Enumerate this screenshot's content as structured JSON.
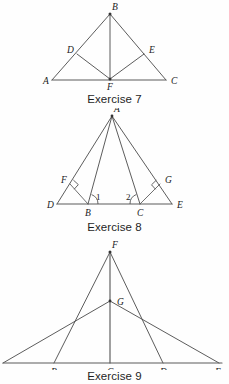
{
  "page": {
    "background_color": "#fefefe",
    "ink_color": "#4a4a4a",
    "label_color": "#1a1a1a"
  },
  "figures": [
    {
      "id": "figure-7",
      "caption": "Exercise 7",
      "description": "Triangle ABC with cevian BF to base AC, and segments DF and EF drawn to points D on AB and E on BC.",
      "points": [
        {
          "name": "A",
          "label": "A",
          "x": 52,
          "y": 80,
          "label_dx": -9,
          "label_dy": 4
        },
        {
          "name": "B",
          "label": "B",
          "x": 110,
          "y": 14,
          "label_dx": 2,
          "label_dy": -4
        },
        {
          "name": "C",
          "label": "C",
          "x": 166,
          "y": 80,
          "label_dx": 5,
          "label_dy": 4
        },
        {
          "name": "D",
          "label": "D",
          "x": 77,
          "y": 54,
          "label_dx": -10,
          "label_dy": -1
        },
        {
          "name": "E",
          "label": "E",
          "x": 144,
          "y": 54,
          "label_dx": 5,
          "label_dy": -1
        },
        {
          "name": "F",
          "label": "F",
          "x": 110,
          "y": 79,
          "label_dx": -2,
          "label_dy": 11
        }
      ],
      "segments": [
        {
          "from": "A",
          "to": "B",
          "style": "gline"
        },
        {
          "from": "B",
          "to": "C",
          "style": "gline"
        },
        {
          "from": "A",
          "to": "C",
          "style": "gline-base"
        },
        {
          "from": "B",
          "to": "F",
          "style": "gline"
        },
        {
          "from": "D",
          "to": "F",
          "style": "gline"
        },
        {
          "from": "E",
          "to": "F",
          "style": "gline"
        }
      ],
      "vertex_dots": [
        "B",
        "F"
      ],
      "angle_marks": [],
      "right_angles": []
    },
    {
      "id": "figure-8",
      "caption": "Exercise 8",
      "description": "Triangle with apex A over base line D-B-C-E. Segments AD and AE form perpendiculars AF and AG to the extended sides; angles 1 and 2 marked at B and C.",
      "points": [
        {
          "name": "A",
          "label": "A",
          "x": 112,
          "y": 118,
          "label_dx": 2,
          "label_dy": -4
        },
        {
          "name": "D",
          "label": "D",
          "x": 57,
          "y": 206,
          "label_dx": -10,
          "label_dy": 4
        },
        {
          "name": "B",
          "label": "B",
          "x": 88,
          "y": 206,
          "label_dx": -2,
          "label_dy": 12
        },
        {
          "name": "C",
          "label": "C",
          "x": 140,
          "y": 206,
          "label_dx": -2,
          "label_dy": 12
        },
        {
          "name": "E",
          "label": "E",
          "x": 172,
          "y": 206,
          "label_dx": 5,
          "label_dy": 4
        },
        {
          "name": "F",
          "label": "F",
          "x": 70,
          "y": 186,
          "label_dx": -9,
          "label_dy": -1
        },
        {
          "name": "G",
          "label": "G",
          "x": 160,
          "y": 186,
          "label_dx": 5,
          "label_dy": -1
        }
      ],
      "segments": [
        {
          "from": "A",
          "to": "D",
          "style": "gline"
        },
        {
          "from": "A",
          "to": "E",
          "style": "gline"
        },
        {
          "from": "A",
          "to": "B",
          "style": "gline"
        },
        {
          "from": "A",
          "to": "C",
          "style": "gline"
        },
        {
          "from": "D",
          "to": "E",
          "style": "gline-base"
        },
        {
          "from": "B",
          "to": "F",
          "style": "gline-thin"
        },
        {
          "from": "C",
          "to": "G",
          "style": "gline-thin"
        }
      ],
      "vertex_dots": [
        "A"
      ],
      "angle_marks": [
        {
          "label": "1",
          "at": "B",
          "label_x": 96,
          "label_y": 199
        },
        {
          "label": "2",
          "at": "C",
          "label_x": 126,
          "label_y": 199
        }
      ],
      "right_angles": [
        {
          "at": "F",
          "note": "right angle between BF and AD"
        },
        {
          "at": "G",
          "note": "right angle between CG and AE"
        }
      ]
    },
    {
      "id": "figure-9",
      "caption": "Exercise 9",
      "description": "Large triangle with apex F over base line, inner triangle with apex G over base B-D; vertical segment FC drawn from F through G to C on the base.",
      "points": [
        {
          "name": "F",
          "label": "F",
          "x": 110,
          "y": 254,
          "label_dx": 2,
          "label_dy": -4
        },
        {
          "name": "G",
          "label": "G",
          "x": 110,
          "y": 303,
          "label_dx": 6,
          "label_dy": 3
        },
        {
          "name": "B",
          "label": "B",
          "x": 54,
          "y": 365,
          "label_dx": -2,
          "label_dy": 12
        },
        {
          "name": "C",
          "label": "C",
          "x": 110,
          "y": 365,
          "label_dx": -2,
          "label_dy": 12
        },
        {
          "name": "D",
          "label": "D",
          "x": 163,
          "y": 365,
          "label_dx": -2,
          "label_dy": 12
        },
        {
          "name": "E",
          "label": "E",
          "x": 219,
          "y": 365,
          "label_dx": 3,
          "label_dy": 12
        },
        {
          "name": "L",
          "label": "",
          "x": 3,
          "y": 365,
          "label_dx": 0,
          "label_dy": 0
        }
      ],
      "segments": [
        {
          "from": "F",
          "to": "B",
          "style": "gline"
        },
        {
          "from": "F",
          "to": "D",
          "style": "gline"
        },
        {
          "from": "G",
          "to": "L",
          "style": "gline"
        },
        {
          "from": "G",
          "to": "E",
          "style": "gline"
        },
        {
          "from": "F",
          "to": "C",
          "style": "gline-base"
        },
        {
          "from": "L",
          "to": "E",
          "style": "gline-base"
        }
      ],
      "vertex_dots": [
        "F",
        "G"
      ],
      "angle_marks": [],
      "right_angles": []
    }
  ]
}
